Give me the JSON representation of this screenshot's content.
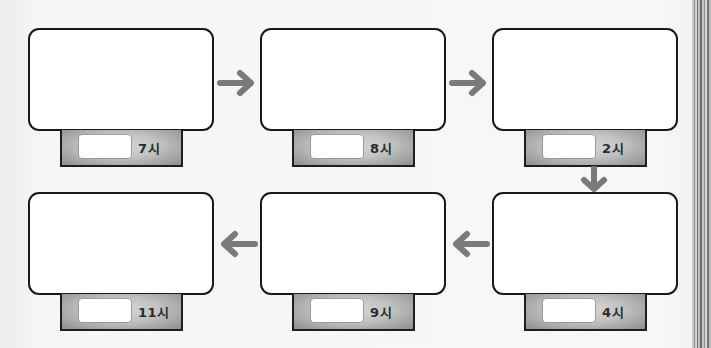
{
  "worksheet": {
    "layout": "snake sequence, 2 rows x 3 columns",
    "colors": {
      "frame_border": "#1a1a1a",
      "frame_fill": "#ffffff",
      "tab_fill": "#c2c2c2",
      "arrow": "#7a7a7a",
      "background": "#f6f6f6"
    },
    "steps": [
      {
        "order": 1,
        "time_label": "7시"
      },
      {
        "order": 2,
        "time_label": "8시"
      },
      {
        "order": 3,
        "time_label": "2시"
      },
      {
        "order": 4,
        "time_label": "4시"
      },
      {
        "order": 5,
        "time_label": "9시"
      },
      {
        "order": 6,
        "time_label": "11시"
      }
    ],
    "arrows": [
      {
        "from": 1,
        "to": 2,
        "direction": "right",
        "icon": "arrow-right-icon"
      },
      {
        "from": 2,
        "to": 3,
        "direction": "right",
        "icon": "arrow-right-icon"
      },
      {
        "from": 3,
        "to": 4,
        "direction": "down",
        "icon": "arrow-down-icon"
      },
      {
        "from": 4,
        "to": 5,
        "direction": "left",
        "icon": "arrow-left-icon"
      },
      {
        "from": 5,
        "to": 6,
        "direction": "left",
        "icon": "arrow-left-icon"
      }
    ]
  }
}
